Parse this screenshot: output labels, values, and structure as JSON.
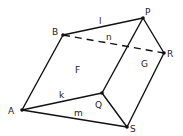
{
  "diagram": {
    "type": "prism",
    "vertices": [
      {
        "id": "A",
        "label": "A",
        "x": 22,
        "y": 110,
        "lx": 8,
        "ly": 114
      },
      {
        "id": "B",
        "label": "B",
        "x": 63,
        "y": 35,
        "lx": 52,
        "ly": 35
      },
      {
        "id": "P",
        "label": "P",
        "x": 143,
        "y": 18,
        "lx": 145,
        "ly": 15
      },
      {
        "id": "R",
        "label": "R",
        "x": 164,
        "y": 53,
        "lx": 167,
        "ly": 57
      },
      {
        "id": "Q",
        "label": "Q",
        "x": 102,
        "y": 93,
        "lx": 95,
        "ly": 108
      },
      {
        "id": "S",
        "label": "S",
        "x": 127,
        "y": 127,
        "lx": 130,
        "ly": 132
      }
    ],
    "edges": [
      {
        "from": "A",
        "to": "B",
        "style": "solid"
      },
      {
        "from": "B",
        "to": "P",
        "style": "solid",
        "label": "l",
        "lx": 99,
        "ly": 24
      },
      {
        "from": "B",
        "to": "R",
        "style": "dashed",
        "label": "n",
        "lx": 106,
        "ly": 40
      },
      {
        "from": "P",
        "to": "R",
        "style": "solid"
      },
      {
        "from": "P",
        "to": "Q",
        "style": "solid"
      },
      {
        "from": "R",
        "to": "S",
        "style": "solid"
      },
      {
        "from": "A",
        "to": "Q",
        "style": "solid",
        "label": "k",
        "lx": 59,
        "ly": 98
      },
      {
        "from": "A",
        "to": "S",
        "style": "solid",
        "label": "m",
        "lx": 74,
        "ly": 116
      },
      {
        "from": "Q",
        "to": "S",
        "style": "solid"
      }
    ],
    "faces": [
      {
        "label": "F",
        "x": 75,
        "y": 73
      },
      {
        "label": "G",
        "x": 141,
        "y": 67
      }
    ]
  },
  "labels": {
    "A": "A",
    "B": "B",
    "P": "P",
    "R": "R",
    "Q": "Q",
    "S": "S",
    "l": "l",
    "n": "n",
    "k": "k",
    "m": "m",
    "F": "F",
    "G": "G"
  }
}
